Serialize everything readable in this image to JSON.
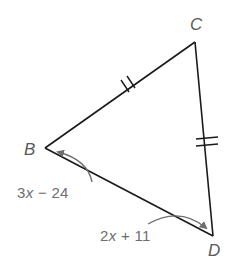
{
  "figure": {
    "type": "isosceles-triangle",
    "vertices": [
      {
        "id": "B",
        "label": "B"
      },
      {
        "id": "C",
        "label": "C"
      },
      {
        "id": "D",
        "label": "D"
      }
    ],
    "congruent_sides": [
      "BC",
      "CD"
    ],
    "tick_marks_per_side": 2,
    "angles": {
      "B": {
        "coef": "3",
        "var": "x",
        "rest": " − 24"
      },
      "D": {
        "coef": "2",
        "var": "x",
        "rest": " + 11"
      }
    },
    "colors": {
      "line": "#1a1a1a",
      "arrow": "#6e6e6e",
      "label": "#5a5a5a"
    }
  }
}
